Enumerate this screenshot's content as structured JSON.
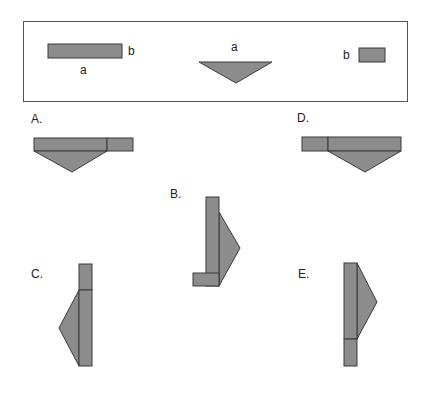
{
  "colors": {
    "shape_fill": "#8c8c8c",
    "shape_stroke": "#3a3a3a",
    "frame": "#555555"
  },
  "given": {
    "rectangle": {
      "side_long": "a",
      "side_short": "b"
    },
    "triangle": {
      "base": "a"
    },
    "square": {
      "side": "b"
    }
  },
  "options": [
    {
      "label": "A."
    },
    {
      "label": "B."
    },
    {
      "label": "C."
    },
    {
      "label": "D."
    },
    {
      "label": "E."
    }
  ]
}
